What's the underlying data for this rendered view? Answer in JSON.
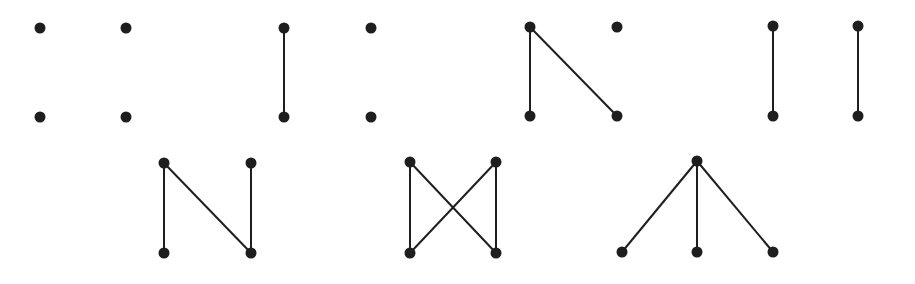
{
  "diagram": {
    "style": {
      "vertex_color": "#1e1e1e",
      "edge_color": "#1e1e1e",
      "vertex_radius": 5.5,
      "edge_width": 2
    },
    "graphs": [
      {
        "id": "graph-1",
        "vertices": [
          [
            40,
            28
          ],
          [
            126,
            28
          ],
          [
            40,
            117
          ],
          [
            126,
            117
          ]
        ],
        "edges": []
      },
      {
        "id": "graph-2",
        "vertices": [
          [
            284,
            28
          ],
          [
            371,
            28
          ],
          [
            284,
            117
          ],
          [
            371,
            117
          ]
        ],
        "edges": [
          [
            0,
            2
          ]
        ]
      },
      {
        "id": "graph-3",
        "vertices": [
          [
            530,
            27
          ],
          [
            617,
            27
          ],
          [
            530,
            116
          ],
          [
            617,
            116
          ]
        ],
        "edges": [
          [
            0,
            2
          ],
          [
            0,
            3
          ]
        ]
      },
      {
        "id": "graph-4",
        "vertices": [
          [
            773,
            26
          ],
          [
            858,
            26
          ],
          [
            773,
            116
          ],
          [
            858,
            116
          ]
        ],
        "edges": [
          [
            0,
            2
          ],
          [
            1,
            3
          ]
        ]
      },
      {
        "id": "graph-5",
        "vertices": [
          [
            164,
            163
          ],
          [
            251,
            163
          ],
          [
            164,
            253
          ],
          [
            251,
            253
          ]
        ],
        "edges": [
          [
            0,
            2
          ],
          [
            0,
            3
          ],
          [
            1,
            3
          ]
        ]
      },
      {
        "id": "graph-6",
        "vertices": [
          [
            410,
            162
          ],
          [
            496,
            162
          ],
          [
            410,
            253
          ],
          [
            496,
            253
          ]
        ],
        "edges": [
          [
            0,
            2
          ],
          [
            0,
            3
          ],
          [
            1,
            2
          ],
          [
            1,
            3
          ]
        ]
      },
      {
        "id": "graph-7",
        "vertices": [
          [
            697,
            161
          ],
          [
            622,
            252
          ],
          [
            697,
            252
          ],
          [
            773,
            252
          ]
        ],
        "edges": [
          [
            0,
            1
          ],
          [
            0,
            2
          ],
          [
            0,
            3
          ]
        ]
      }
    ]
  }
}
